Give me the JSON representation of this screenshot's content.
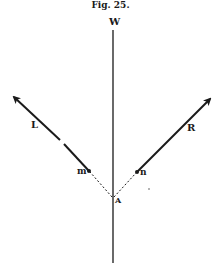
{
  "figure": {
    "title": "Fig. 25.",
    "labels": {
      "top": "W",
      "left_force": "L",
      "right_force": "R",
      "left_point": "m",
      "right_point": "n",
      "origin": "A"
    },
    "colors": {
      "ink": "#1a1a1a",
      "background": "#ffffff"
    }
  }
}
